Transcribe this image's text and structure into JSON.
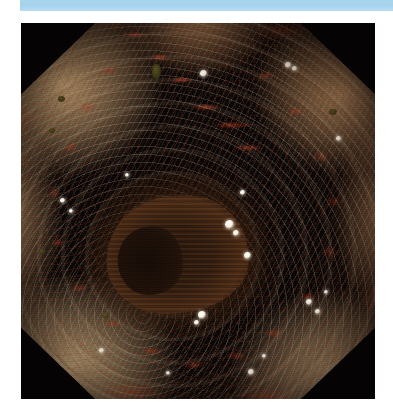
{
  "page": {
    "background_color": "#ffffff",
    "width": 393,
    "height": 416
  },
  "top_banner": {
    "label": "",
    "color": "#a9d4ee"
  },
  "figure": {
    "name": "endoscopy-photograph",
    "modality": "endoscopy",
    "frame_color": "#050303",
    "frame_shape": "octagon",
    "background_color": "#000000",
    "mucosa": {
      "base_color": "#d89257",
      "highlight_color": "#ecc48c",
      "shadow_color": "#b86c39",
      "erythema_color": "#c4341a",
      "debris_color": "#5d5622",
      "fleck_color": "#ffffff"
    },
    "lumen": {
      "color": "#2e1a0d",
      "deep_color": "#150a05",
      "ridge_color": "#7a4a22"
    },
    "flecks": [
      {
        "left": "50.5%",
        "top": "12.5%",
        "size": "7px"
      },
      {
        "left": "74.5%",
        "top": "10.5%",
        "size": "6px"
      },
      {
        "left": "76.5%",
        "top": "11.5%",
        "size": "5px"
      },
      {
        "left": "11.0%",
        "top": "46.5%",
        "size": "5px"
      },
      {
        "left": "13.5%",
        "top": "49.5%",
        "size": "4px"
      },
      {
        "left": "57.5%",
        "top": "52.5%",
        "size": "9px"
      },
      {
        "left": "60.0%",
        "top": "55.0%",
        "size": "6px"
      },
      {
        "left": "62.0%",
        "top": "44.5%",
        "size": "5px"
      },
      {
        "left": "63.0%",
        "top": "61.0%",
        "size": "7px"
      },
      {
        "left": "50.0%",
        "top": "76.5%",
        "size": "8px"
      },
      {
        "left": "49.0%",
        "top": "79.0%",
        "size": "5px"
      },
      {
        "left": "80.5%",
        "top": "73.5%",
        "size": "6px"
      },
      {
        "left": "83.0%",
        "top": "76.0%",
        "size": "5px"
      },
      {
        "left": "85.5%",
        "top": "71.0%",
        "size": "4px"
      },
      {
        "left": "22.0%",
        "top": "86.5%",
        "size": "5px"
      },
      {
        "left": "64.0%",
        "top": "92.0%",
        "size": "6px"
      },
      {
        "left": "68.0%",
        "top": "88.0%",
        "size": "4px"
      },
      {
        "left": "89.0%",
        "top": "30.0%",
        "size": "5px"
      },
      {
        "left": "29.5%",
        "top": "40.0%",
        "size": "4px"
      },
      {
        "left": "41.0%",
        "top": "92.5%",
        "size": "4px"
      }
    ],
    "debris_specks": [
      {
        "left": "37.0%",
        "top": "11.0%",
        "width": "9px",
        "height": "15px"
      },
      {
        "left": "10.5%",
        "top": "19.5%",
        "width": "7px",
        "height": "6px"
      },
      {
        "left": "8.0%",
        "top": "28.0%",
        "width": "6px",
        "height": "5px"
      },
      {
        "left": "23.0%",
        "top": "77.0%",
        "width": "7px",
        "height": "5px"
      },
      {
        "left": "87.0%",
        "top": "23.0%",
        "width": "8px",
        "height": "6px"
      },
      {
        "left": "5.0%",
        "top": "60.0%",
        "width": "6px",
        "height": "5px"
      }
    ]
  }
}
